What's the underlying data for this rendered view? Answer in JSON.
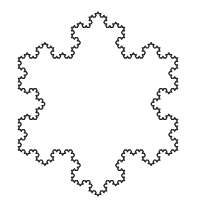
{
  "figure": {
    "iterations": 4,
    "center": [
      98,
      104
    ],
    "radius": 92,
    "start_angle_deg": -90,
    "stroke_color": "#222222",
    "stroke_width": 1.3,
    "fill": "none",
    "background": "#ffffff"
  }
}
